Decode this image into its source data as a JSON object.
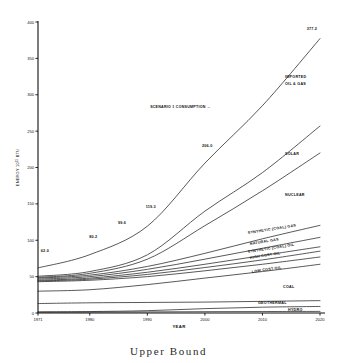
{
  "caption": "Upper  Bound",
  "chart_data": {
    "type": "line",
    "title": "",
    "xlabel": "YEAR",
    "ylabel_main": "ENERGY 10",
    "ylabel_exp": "15",
    "ylabel_unit": " BTU",
    "x": [
      1971,
      1980,
      1990,
      2000,
      2010,
      2020
    ],
    "xlim": [
      1971,
      2020
    ],
    "ylim": [
      0,
      400
    ],
    "xticks": [
      "1971",
      "1980",
      "1990",
      "2000",
      "2010",
      "2020"
    ],
    "yticks": [
      "0",
      "50",
      "100",
      "150",
      "200",
      "250",
      "300",
      "350",
      "400"
    ],
    "ytick_values": [
      0,
      50,
      100,
      150,
      200,
      250,
      300,
      350,
      400
    ],
    "grid": false,
    "legend": "inline-right-labels",
    "annotations": [
      {
        "name": "scenario-arrow",
        "text": "SCENARIO 1 CONSUMPTION →",
        "x": 2001,
        "y": 282
      },
      {
        "name": "value-1971",
        "text": "62.0",
        "x": 1972.2,
        "y": 84
      },
      {
        "name": "value-1980",
        "text": "80.2",
        "x": 1980.6,
        "y": 103
      },
      {
        "name": "value-1985",
        "text": "99.6",
        "x": 1985.6,
        "y": 122
      },
      {
        "name": "value-1990",
        "text": "119.3",
        "x": 1990.6,
        "y": 144
      },
      {
        "name": "value-2000",
        "text": "206.0",
        "x": 2000.4,
        "y": 228
      },
      {
        "name": "value-2020",
        "text": "377.2",
        "x": 2018.6,
        "y": 389
      }
    ],
    "series": [
      {
        "name": "SCENARIO 1 CONSUMPTION",
        "label": "",
        "label_lines": [],
        "values": [
          62.0,
          80.2,
          119.3,
          206.0,
          285.0,
          377.2
        ]
      },
      {
        "name": "IMPORTED OIL & GAS",
        "label": "IMPORTED OIL & GAS",
        "label_lines": [
          "IMPORTED",
          "OIL & GAS"
        ],
        "values": [
          50.5,
          57.0,
          80.0,
          140.0,
          193.0,
          257.0
        ]
      },
      {
        "name": "SOLAR",
        "label": "SOLAR",
        "label_lines": [
          "SOLAR"
        ],
        "values": [
          49.0,
          54.5,
          74.0,
          120.0,
          168.0,
          220.0
        ]
      },
      {
        "name": "NUCLEAR",
        "label": "NUCLEAR",
        "label_lines": [
          "NUCLEAR"
        ],
        "values": [
          48.0,
          52.0,
          64.0,
          82.0,
          102.0,
          120.5
        ]
      },
      {
        "name": "SYNTHETIC (COAL) GAS",
        "label": "SYNTHETIC (COAL) GAS",
        "label_lines": [
          "SYNTHETIC (COAL) GAS"
        ],
        "values": [
          46.5,
          50.0,
          60.0,
          74.0,
          89.0,
          104.0
        ]
      },
      {
        "name": "NATURAL GAS",
        "label": "NATURAL GAS",
        "label_lines": [
          "NATURAL GAS"
        ],
        "values": [
          45.0,
          48.0,
          56.0,
          67.0,
          79.0,
          91.0
        ]
      },
      {
        "name": "SYNTHETIC (COAL) OIL",
        "label": "SYNTHETIC (COAL) OIL",
        "label_lines": [
          "SYNTHETIC (COAL) OIL"
        ],
        "values": [
          44.0,
          46.5,
          53.0,
          62.5,
          73.0,
          85.0
        ]
      },
      {
        "name": "HIGH COST OIL",
        "label": "HIGH COST OIL",
        "label_lines": [
          "HIGH COST OIL"
        ],
        "values": [
          43.0,
          45.0,
          50.0,
          58.0,
          67.0,
          77.0
        ]
      },
      {
        "name": "LOW COST OIL",
        "label": "LOW COST OIL",
        "label_lines": [
          "LOW COST OIL"
        ],
        "values": [
          30.0,
          32.0,
          39.0,
          48.0,
          57.0,
          67.0
        ]
      },
      {
        "name": "COAL",
        "label": "COAL",
        "label_lines": [
          "COAL"
        ],
        "values": [
          13.0,
          14.0,
          14.5,
          15.0,
          16.0,
          17.0
        ]
      },
      {
        "name": "GEOTHERMAL",
        "label": "GEOTHERMAL",
        "label_lines": [
          "GEOTHERMAL"
        ],
        "values": [
          1.6,
          2.0,
          3.2,
          6.0,
          8.0,
          9.0
        ]
      },
      {
        "name": "HYDRO",
        "label": "HYDRO",
        "label_lines": [
          "HYDRO"
        ],
        "values": [
          1.0,
          1.2,
          1.5,
          1.8,
          2.0,
          2.2
        ]
      }
    ]
  }
}
